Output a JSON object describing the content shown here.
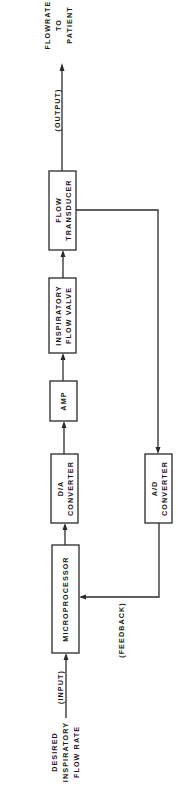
{
  "diagram": {
    "orientation": "rotated-90-ccw",
    "blocks": {
      "microprocessor": {
        "line1": "MICROPROCESSOR"
      },
      "da_converter": {
        "line1": "D/A",
        "line2": "CONVERTER"
      },
      "amp": {
        "line1": "AMP"
      },
      "inspiratory_flow_valve": {
        "line1": "INSPIRATORY",
        "line2": "FLOW VALVE"
      },
      "flow_transducer": {
        "line1": "FLOW",
        "line2": "TRANSDUCER"
      },
      "ad_converter": {
        "line1": "A/D",
        "line2": "CONVERTER"
      }
    },
    "input": {
      "label": "(INPUT)",
      "source_line1": "DESIRED",
      "source_line2": "INSPIRATORY",
      "source_line3": "FLOW RATE"
    },
    "output": {
      "label": "(OUTPUT)",
      "dest_line1": "FLOWRATE",
      "dest_line2": "TO",
      "dest_line3": "PATIENT"
    },
    "feedback": {
      "label": "(FEEDBACK)"
    },
    "connections": [
      "DESIRED INSPIRATORY FLOW RATE -> MICROPROCESSOR",
      "MICROPROCESSOR -> D/A CONVERTER",
      "D/A CONVERTER -> AMP",
      "AMP -> INSPIRATORY FLOW VALVE",
      "INSPIRATORY FLOW VALVE -> FLOW TRANSDUCER",
      "FLOW TRANSDUCER -> FLOWRATE TO PATIENT",
      "FLOW TRANSDUCER -> A/D CONVERTER",
      "A/D CONVERTER -> MICROPROCESSOR"
    ]
  }
}
